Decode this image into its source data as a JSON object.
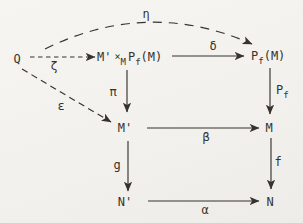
{
  "diagram": {
    "background_color": "#f2f1ee",
    "ink_color": "#37332c",
    "nodes": {
      "q": "Q",
      "pullback": {
        "m_prime": "M'",
        "times": "×",
        "times_sub": "M",
        "p": "P",
        "p_sub": "f",
        "arg": "(M)"
      },
      "pf_of_m": {
        "p": "P",
        "sub": "f",
        "arg": "(M)"
      },
      "m_prime": "M'",
      "m": "M",
      "n_prime": "N'",
      "n": "N"
    },
    "arrow_labels": {
      "eta": "η",
      "zeta": "ζ",
      "epsilon": "ε",
      "delta": "δ",
      "pi": "π",
      "pf": {
        "p": "P",
        "sub": "f"
      },
      "beta": "β",
      "g": "g",
      "f": "f",
      "alpha": "α"
    },
    "arrow_styles": {
      "eta": "dashed",
      "zeta": "dashed",
      "epsilon": "dashed",
      "delta": "solid",
      "pi": "solid",
      "pf": "solid",
      "beta": "solid",
      "g": "solid",
      "f": "solid",
      "alpha": "solid"
    }
  }
}
